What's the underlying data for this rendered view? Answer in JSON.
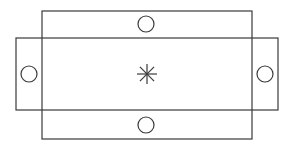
{
  "diagram": {
    "stroke_color": "#3a3a3a",
    "background": "#ffffff",
    "shapes": {
      "vertical_rect": {
        "x": 42,
        "y": 11,
        "width": 210,
        "height": 128
      },
      "horizontal_rect": {
        "x": 16,
        "y": 38,
        "width": 262,
        "height": 72
      },
      "circles": [
        {
          "name": "top",
          "cx": 146,
          "cy": 24,
          "r": 8
        },
        {
          "name": "bottom",
          "cx": 146,
          "cy": 125,
          "r": 8
        },
        {
          "name": "left",
          "cx": 29,
          "cy": 74,
          "r": 8
        },
        {
          "name": "right",
          "cx": 265,
          "cy": 74,
          "r": 8
        }
      ],
      "asterisk": {
        "cx": 147,
        "cy": 74,
        "arm": 10
      }
    }
  }
}
